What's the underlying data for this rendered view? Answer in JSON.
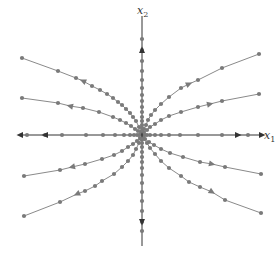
{
  "diagram": {
    "type": "phase-portrait",
    "colors": {
      "axis": "#333333",
      "trajectory": "#8a8a8a",
      "dot": "#7a7a7a",
      "label": "#333333",
      "background": "#ffffff"
    },
    "origin": [
      142,
      135
    ],
    "axes": {
      "x": {
        "label": "x",
        "subscript": "1",
        "from": [
          20,
          135
        ],
        "to": [
          262,
          135
        ],
        "label_pos": [
          264,
          139
        ]
      },
      "y": {
        "label": "x",
        "subscript": "2",
        "from": [
          142,
          246
        ],
        "to": [
          142,
          16
        ],
        "label_pos": [
          137,
          14
        ]
      }
    },
    "trajectories": [
      {
        "id": "upper-left-outer",
        "points": [
          [
            22,
            58
          ],
          [
            58,
            71
          ],
          [
            76,
            78
          ],
          [
            83,
            81
          ],
          [
            92,
            86
          ],
          [
            100,
            90
          ],
          [
            107,
            94
          ],
          [
            113,
            98
          ],
          [
            118,
            102
          ],
          [
            122,
            105
          ],
          [
            126,
            109
          ],
          [
            130,
            113
          ],
          [
            133,
            117
          ],
          [
            136,
            121
          ],
          [
            139,
            127
          ],
          [
            141,
            132
          ]
        ],
        "arrow_at": 3,
        "arrow_dir": "out"
      },
      {
        "id": "upper-left-inner",
        "points": [
          [
            22,
            98
          ],
          [
            58,
            103
          ],
          [
            70,
            106
          ],
          [
            83,
            108
          ],
          [
            99,
            112
          ],
          [
            113,
            117
          ],
          [
            120,
            120
          ],
          [
            126,
            123
          ],
          [
            131,
            126
          ],
          [
            135,
            129
          ],
          [
            138,
            131
          ],
          [
            141,
            134
          ]
        ],
        "arrow_at": 2,
        "arrow_dir": "out"
      },
      {
        "id": "upper-right-outer",
        "points": [
          [
            259,
            54
          ],
          [
            222,
            68
          ],
          [
            198,
            80
          ],
          [
            189,
            84
          ],
          [
            181,
            88
          ],
          [
            169,
            97
          ],
          [
            161,
            104
          ],
          [
            155,
            110
          ],
          [
            151,
            115
          ],
          [
            148,
            120
          ],
          [
            146,
            125
          ],
          [
            144,
            129
          ],
          [
            143,
            132
          ]
        ],
        "arrow_at": 3,
        "arrow_dir": "out"
      },
      {
        "id": "upper-right-inner",
        "points": [
          [
            259,
            94
          ],
          [
            222,
            101
          ],
          [
            210,
            104
          ],
          [
            198,
            107
          ],
          [
            181,
            112
          ],
          [
            169,
            116
          ],
          [
            161,
            120
          ],
          [
            155,
            124
          ],
          [
            150,
            127
          ],
          [
            147,
            130
          ],
          [
            144,
            133
          ]
        ],
        "arrow_at": 2,
        "arrow_dir": "out"
      },
      {
        "id": "lower-left-inner",
        "points": [
          [
            24,
            176
          ],
          [
            60,
            170
          ],
          [
            72,
            167
          ],
          [
            85,
            164
          ],
          [
            102,
            159
          ],
          [
            114,
            155
          ],
          [
            122,
            151
          ],
          [
            128,
            147
          ],
          [
            133,
            144
          ],
          [
            137,
            141
          ],
          [
            140,
            138
          ]
        ],
        "arrow_at": 2,
        "arrow_dir": "out"
      },
      {
        "id": "lower-left-outer",
        "points": [
          [
            24,
            216
          ],
          [
            60,
            202
          ],
          [
            77,
            194
          ],
          [
            85,
            191
          ],
          [
            95,
            186
          ],
          [
            102,
            181
          ],
          [
            114,
            174
          ],
          [
            122,
            167
          ],
          [
            128,
            161
          ],
          [
            133,
            155
          ],
          [
            136,
            149
          ],
          [
            139,
            143
          ],
          [
            141,
            139
          ]
        ],
        "arrow_at": 2,
        "arrow_dir": "out"
      },
      {
        "id": "lower-right-inner",
        "points": [
          [
            261,
            174
          ],
          [
            225,
            167
          ],
          [
            212,
            164
          ],
          [
            200,
            162
          ],
          [
            183,
            157
          ],
          [
            170,
            153
          ],
          [
            161,
            149
          ],
          [
            154,
            145
          ],
          [
            149,
            142
          ],
          [
            145,
            139
          ],
          [
            143,
            137
          ]
        ],
        "arrow_at": 2,
        "arrow_dir": "out"
      },
      {
        "id": "lower-right-outer",
        "points": [
          [
            261,
            213
          ],
          [
            225,
            200
          ],
          [
            212,
            192
          ],
          [
            200,
            187
          ],
          [
            189,
            182
          ],
          [
            181,
            176
          ],
          [
            169,
            168
          ],
          [
            161,
            161
          ],
          [
            155,
            154
          ],
          [
            150,
            148
          ],
          [
            147,
            143
          ],
          [
            144,
            139
          ]
        ],
        "arrow_at": 2,
        "arrow_dir": "out"
      }
    ],
    "axis_trajectories": [
      {
        "id": "positive-x1",
        "points": [
          [
            248,
            135
          ],
          [
            222,
            135
          ],
          [
            198,
            135
          ],
          [
            180,
            135
          ],
          [
            169,
            135
          ],
          [
            161,
            135
          ],
          [
            155,
            135
          ],
          [
            150,
            135
          ],
          [
            147,
            135
          ],
          [
            145,
            135
          ]
        ],
        "arrow": [
          238,
          135
        ],
        "arrow_dir": "right"
      },
      {
        "id": "negative-x1",
        "points": [
          [
            27,
            135
          ],
          [
            45,
            135
          ],
          [
            62,
            135
          ],
          [
            86,
            135
          ],
          [
            103,
            135
          ],
          [
            115,
            135
          ],
          [
            124,
            135
          ],
          [
            130,
            135
          ],
          [
            134,
            135
          ],
          [
            137,
            135
          ],
          [
            139,
            135
          ]
        ],
        "arrow": [
          45,
          135
        ],
        "arrow_dir": "left"
      },
      {
        "id": "positive-x2",
        "points": [
          [
            142,
            39
          ],
          [
            142,
            50
          ],
          [
            142,
            61
          ],
          [
            142,
            71
          ],
          [
            142,
            80
          ],
          [
            142,
            88
          ],
          [
            142,
            95
          ],
          [
            142,
            101
          ],
          [
            142,
            107
          ],
          [
            142,
            112
          ],
          [
            142,
            117
          ],
          [
            142,
            121
          ],
          [
            142,
            125
          ],
          [
            142,
            128
          ],
          [
            142,
            131
          ]
        ],
        "arrow": [
          142,
          50
        ],
        "arrow_dir": "up"
      },
      {
        "id": "negative-x2",
        "points": [
          [
            142,
            139
          ],
          [
            142,
            143
          ],
          [
            142,
            147
          ],
          [
            142,
            152
          ],
          [
            142,
            157
          ],
          [
            142,
            162
          ],
          [
            142,
            168
          ],
          [
            142,
            175
          ],
          [
            142,
            183
          ],
          [
            142,
            192
          ],
          [
            142,
            201
          ],
          [
            142,
            211
          ],
          [
            142,
            222
          ],
          [
            142,
            231
          ]
        ],
        "arrow": [
          142,
          222
        ],
        "arrow_dir": "down"
      }
    ]
  }
}
